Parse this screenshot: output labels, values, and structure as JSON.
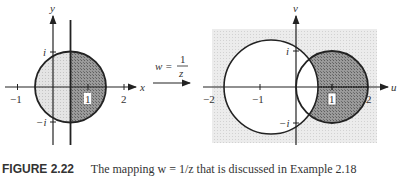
{
  "figure": {
    "caption_label": "FIGURE 2.22",
    "caption_text": "The mapping w = 1/z that is discussed in Example 2.18"
  },
  "mapping": {
    "lhs": "w =",
    "numerator": "1",
    "denominator": "z"
  },
  "left_plot": {
    "x_axis_label": "x",
    "y_axis_label": "y",
    "x_ticks": [
      "−1",
      "1",
      "2"
    ],
    "y_ticks": [
      "i",
      "−i"
    ],
    "description": "Disk |z − 1/2| < 1 split by vertical line x = 1/2; left part light shaded, right part dark shaded"
  },
  "right_plot": {
    "x_axis_label": "u",
    "y_axis_label": "v",
    "x_ticks": [
      "−2",
      "−1",
      "1",
      "2"
    ],
    "y_ticks": [
      "i",
      "−i"
    ],
    "description": "Image region: dark shaded disk |w − 1| < 1 outside circle centered near −2/3; exterior lightly shaded"
  },
  "colors": {
    "axis": "#222222",
    "light_shade": "#d9d9d9",
    "dark_shade": "#8c8c8c",
    "background_shade": "#e6e6e6"
  }
}
